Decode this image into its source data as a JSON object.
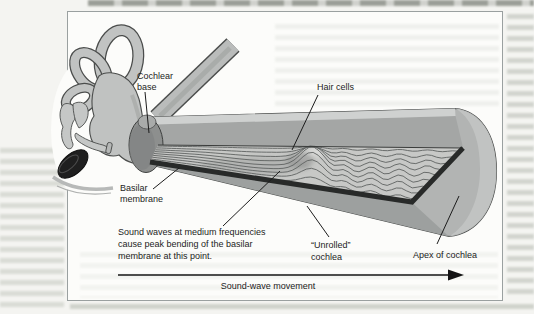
{
  "figure": {
    "type": "anatomical-diagram",
    "labels": {
      "cochlear_base": "Cochlear base",
      "hair_cells": "Hair cells",
      "basilar_membrane": "Basilar membrane",
      "medium_frequency_note": "Sound waves at medium frequencies cause peak bending of the basilar membrane at this point.",
      "unrolled_cochlea": "“Unrolled” cochlea",
      "apex_of_cochlea": "Apex of cochlea",
      "sound_wave_movement": "Sound-wave movement"
    },
    "icons": {
      "sound_wave_arrow": "right-arrow"
    },
    "colors": {
      "page_background": "#f4f4f1",
      "figure_background": "#fcfcfa",
      "frame_border": "#9aa0a0",
      "body_gray": "#b2b4b3",
      "top_highlight": "#cfd1d0",
      "inner_wall": "#a4a6a5",
      "membrane_surface": "#c7c8c6",
      "wave_line": "#5f6261",
      "membrane_rim": "#282a29",
      "cochlear_base_shade": "#8d8f8e",
      "eardrum": "#1f1f1f",
      "outline": "#4b4d4c",
      "label_text": "#1c1c1c"
    }
  }
}
